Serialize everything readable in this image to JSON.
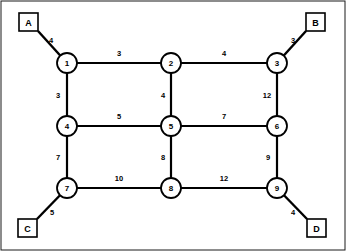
{
  "diagram": {
    "width": 346,
    "height": 251,
    "colors": {
      "background": "#ffffff",
      "stroke": "#000000",
      "frame": "#1a1a1a",
      "node_fill": "#ffffff"
    },
    "frame": {
      "x": 1,
      "y": 1,
      "width": 344,
      "height": 249
    }
  },
  "nodes": [
    {
      "id": "1",
      "label": "1",
      "x": 67,
      "y": 63,
      "r": 10
    },
    {
      "id": "2",
      "label": "2",
      "x": 171,
      "y": 63,
      "r": 10
    },
    {
      "id": "3",
      "label": "3",
      "x": 277,
      "y": 63,
      "r": 10
    },
    {
      "id": "4",
      "label": "4",
      "x": 67,
      "y": 126,
      "r": 10
    },
    {
      "id": "5",
      "label": "5",
      "x": 171,
      "y": 126,
      "r": 10
    },
    {
      "id": "6",
      "label": "6",
      "x": 277,
      "y": 126,
      "r": 10
    },
    {
      "id": "7",
      "label": "7",
      "x": 67,
      "y": 188,
      "r": 10
    },
    {
      "id": "8",
      "label": "8",
      "x": 171,
      "y": 188,
      "r": 10
    },
    {
      "id": "9",
      "label": "9",
      "x": 277,
      "y": 188,
      "r": 10
    }
  ],
  "terminals": [
    {
      "id": "A",
      "label": "A",
      "x": 19,
      "y": 13,
      "width": 19,
      "height": 18,
      "anchor_x": 38,
      "anchor_y": 31
    },
    {
      "id": "B",
      "label": "B",
      "x": 306,
      "y": 13,
      "width": 19,
      "height": 18,
      "anchor_x": 306,
      "anchor_y": 31
    },
    {
      "id": "C",
      "label": "C",
      "x": 18,
      "y": 219,
      "width": 19,
      "height": 18,
      "anchor_x": 37,
      "anchor_y": 219
    },
    {
      "id": "D",
      "label": "D",
      "x": 307,
      "y": 219,
      "width": 19,
      "height": 18,
      "anchor_x": 307,
      "anchor_y": 219
    }
  ],
  "edges": [
    {
      "id": "e1-2",
      "from": "1",
      "to": "2",
      "weight": "3",
      "label_x": 119,
      "label_y": 53,
      "orientation": "horizontal"
    },
    {
      "id": "e2-3",
      "from": "2",
      "to": "3",
      "weight": "4",
      "label_x": 224,
      "label_y": 53,
      "orientation": "horizontal"
    },
    {
      "id": "e1-4",
      "from": "1",
      "to": "4",
      "weight": "3",
      "label_x": 58,
      "label_y": 95,
      "orientation": "vertical"
    },
    {
      "id": "e2-5",
      "from": "2",
      "to": "5",
      "weight": "4",
      "label_x": 163,
      "label_y": 95,
      "orientation": "vertical"
    },
    {
      "id": "e3-6",
      "from": "3",
      "to": "6",
      "weight": "12",
      "label_x": 267,
      "label_y": 95,
      "orientation": "vertical"
    },
    {
      "id": "e4-5",
      "from": "4",
      "to": "5",
      "weight": "5",
      "label_x": 119,
      "label_y": 116,
      "orientation": "horizontal"
    },
    {
      "id": "e5-6",
      "from": "5",
      "to": "6",
      "weight": "7",
      "label_x": 224,
      "label_y": 116,
      "orientation": "horizontal"
    },
    {
      "id": "e4-7",
      "from": "4",
      "to": "7",
      "weight": "7",
      "label_x": 58,
      "label_y": 157,
      "orientation": "vertical"
    },
    {
      "id": "e5-8",
      "from": "5",
      "to": "8",
      "weight": "8",
      "label_x": 163,
      "label_y": 157,
      "orientation": "vertical"
    },
    {
      "id": "e6-9",
      "from": "6",
      "to": "9",
      "weight": "9",
      "label_x": 268,
      "label_y": 157,
      "orientation": "vertical"
    },
    {
      "id": "e7-8",
      "from": "7",
      "to": "8",
      "weight": "10",
      "label_x": 119,
      "label_y": 178,
      "orientation": "horizontal"
    },
    {
      "id": "e8-9",
      "from": "8",
      "to": "9",
      "weight": "12",
      "label_x": 224,
      "label_y": 178,
      "orientation": "horizontal"
    }
  ],
  "terminal_edges": [
    {
      "id": "eA-1",
      "from": "A",
      "to": "1",
      "weight": "4",
      "label_x": 51,
      "label_y": 40
    },
    {
      "id": "eB-3",
      "from": "B",
      "to": "3",
      "weight": "3",
      "label_x": 293,
      "label_y": 40
    },
    {
      "id": "eC-7",
      "from": "C",
      "to": "7",
      "weight": "5",
      "label_x": 52,
      "label_y": 212
    },
    {
      "id": "eD-9",
      "from": "D",
      "to": "9",
      "weight": "4",
      "label_x": 293,
      "label_y": 212
    }
  ],
  "chart_data": {
    "type": "diagram",
    "node_ids": [
      "1",
      "2",
      "3",
      "4",
      "5",
      "6",
      "7",
      "8",
      "9"
    ],
    "terminal_ids": [
      "A",
      "B",
      "C",
      "D"
    ],
    "weighted_edges": [
      {
        "from": "A",
        "to": "1",
        "weight": 4
      },
      {
        "from": "1",
        "to": "2",
        "weight": 3
      },
      {
        "from": "2",
        "to": "3",
        "weight": 4
      },
      {
        "from": "3",
        "to": "B",
        "weight": 3
      },
      {
        "from": "1",
        "to": "4",
        "weight": 3
      },
      {
        "from": "2",
        "to": "5",
        "weight": 4
      },
      {
        "from": "3",
        "to": "6",
        "weight": 12
      },
      {
        "from": "4",
        "to": "5",
        "weight": 5
      },
      {
        "from": "5",
        "to": "6",
        "weight": 7
      },
      {
        "from": "4",
        "to": "7",
        "weight": 7
      },
      {
        "from": "5",
        "to": "8",
        "weight": 8
      },
      {
        "from": "6",
        "to": "9",
        "weight": 9
      },
      {
        "from": "7",
        "to": "8",
        "weight": 10
      },
      {
        "from": "8",
        "to": "9",
        "weight": 12
      },
      {
        "from": "7",
        "to": "C",
        "weight": 5
      },
      {
        "from": "9",
        "to": "D",
        "weight": 4
      }
    ]
  }
}
